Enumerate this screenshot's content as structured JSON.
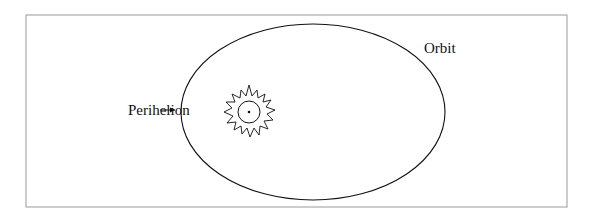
{
  "diagram": {
    "labels": {
      "orbit": "Orbit",
      "perihelion": "Perihelion"
    },
    "elements": {
      "orbit_shape": "ellipse",
      "star_icon": "sun-icon"
    },
    "colors": {
      "stroke": "#111111",
      "frame": "#999999",
      "background": "#ffffff"
    }
  }
}
